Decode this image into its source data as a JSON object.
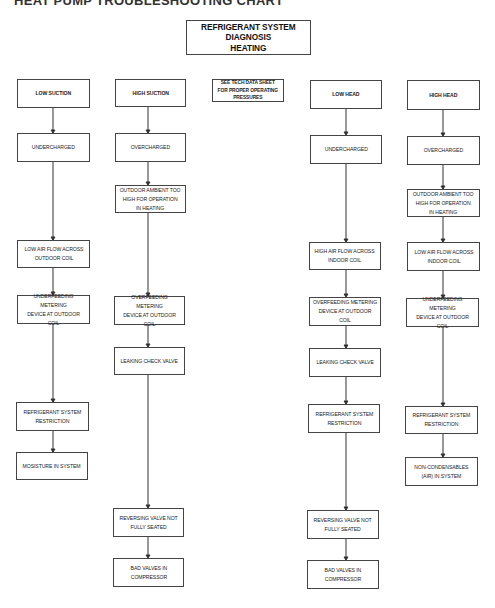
{
  "page_title": "HEAT PUMP TROUBLESHOOTING CHART",
  "diagram_title": "REFRIGERANT SYSTEM\nDIAGNOSIS\nHEATING",
  "note": "SEE TECH DATA SHEET\nFOR PROPER OPERATING\nPRESSURES",
  "columns": [
    {
      "id": "low-suction",
      "header": "LOW SUCTION",
      "steps": [
        "UNDERCHARGED",
        "LOW AIR FLOW ACROSS\nOUTDOOR COIL",
        "UNDERFEEDING METERING\nDEVICE AT OUTDOOR COIL",
        "REFRIGERANT SYSTEM\nRESTRICTION",
        "MOSISTURE IN SYSTEM"
      ]
    },
    {
      "id": "high-suction",
      "header": "HIGH SUCTION",
      "steps": [
        "OVERCHARGED",
        "OUTDOOR AMBIENT TOO\nHIGH FOR OPERATION\nIN HEATING",
        "OVERFEEDING METERING\nDEVICE AT OUTDOOR COIL",
        "LEAKING CHECK VALVE",
        "REVERSING VALVE NOT\nFULLY SEATED",
        "BAD VALVES IN\nCOMPRESSOR"
      ]
    },
    {
      "id": "low-head",
      "header": "LOW HEAD",
      "steps": [
        "UNDERCHARGED",
        "HIGH AIR FLOW ACROSS\nINDOOR COIL",
        "OVERFEEDING METERING\nDEVICE AT OUTDOOR COIL",
        "LEAKING CHECK VALVE",
        "REFRIGERANT SYSTEM\nRESTRICTION",
        "REVERSING VALVE NOT\nFULLY SEATED",
        "BAD VALVES IN\nCOMPRESSOR"
      ]
    },
    {
      "id": "high-head",
      "header": "HIGH HEAD",
      "steps": [
        "OVERCHARGED",
        "OUTDOOR AMBIENT TOO\nHIGH FOR OPERATION\nIN HEATING",
        "LOW AIR FLOW ACROSS\nINDOOR COIL",
        "UNDERFEEDING METERING\nDEVICE AT OUTDOOR COIL",
        "REFRIGERANT SYSTEM\nRESTRICTION",
        "NON-CONDENSABLES\n(AIR) IN SYSTEM"
      ]
    }
  ],
  "colors": {
    "line": "#333333",
    "border": "#444444",
    "background": "#ffffff"
  }
}
